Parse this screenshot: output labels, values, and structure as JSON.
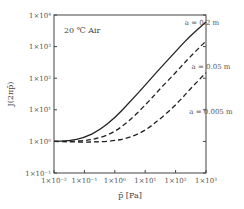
{
  "chart_data": {
    "type": "line",
    "title": "",
    "annotation": "20 ℃ Air",
    "xlabel": "p̄ [Pa]",
    "ylabel": "J(2πp̄)",
    "xscale": "log",
    "yscale": "log",
    "xlim": [
      0.01,
      1000
    ],
    "ylim": [
      0.1,
      10000
    ],
    "grid": false,
    "x_tick_labels": [
      "1×10⁻²",
      "1×10⁻¹",
      "1×10⁰",
      "1×10¹",
      "1×10²",
      "1×10³"
    ],
    "y_tick_labels": [
      "1×10⁴",
      "1×10³",
      "1×10²",
      "1×10¹",
      "1×10⁰",
      "1×10⁻¹"
    ],
    "series": [
      {
        "name": "a = 0.2 m",
        "style": "solid",
        "x": [
          0.01,
          0.03,
          0.1,
          0.3,
          1,
          3,
          10,
          30,
          100,
          300,
          1000
        ],
        "y": [
          1,
          1.05,
          1.3,
          2.2,
          5.5,
          17,
          60,
          200,
          700,
          2200,
          6000
        ]
      },
      {
        "name": "a = 0.05 m",
        "style": "dashed",
        "x": [
          0.01,
          0.03,
          0.1,
          0.3,
          1,
          3,
          10,
          30,
          100,
          300,
          1000
        ],
        "y": [
          1,
          1,
          1.05,
          1.25,
          2,
          4.5,
          14,
          45,
          150,
          480,
          1500
        ]
      },
      {
        "name": "a = 0.005 m",
        "style": "dashed",
        "x": [
          0.01,
          0.03,
          0.1,
          0.3,
          1,
          3,
          10,
          30,
          100,
          300,
          1000
        ],
        "y": [
          1,
          0.97,
          0.95,
          0.97,
          1.05,
          1.3,
          2.2,
          5,
          14,
          45,
          150
        ]
      }
    ],
    "legend_position": "inline-right"
  }
}
